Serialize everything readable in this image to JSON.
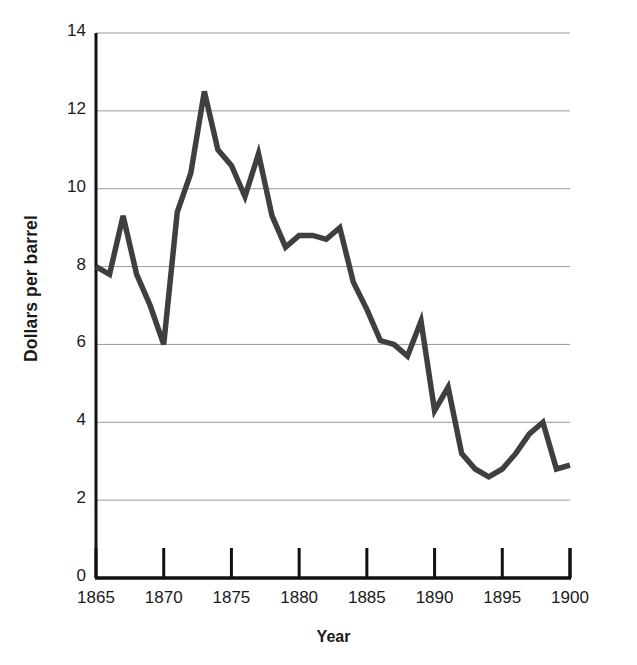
{
  "chart_data": {
    "type": "line",
    "title": "",
    "subtitle": "",
    "xlabel": "Year",
    "ylabel": "Dollars per barrel",
    "xlim": [
      1865,
      1900
    ],
    "ylim": [
      0,
      14
    ],
    "x_ticks": [
      1865,
      1870,
      1875,
      1880,
      1885,
      1890,
      1895,
      1900
    ],
    "x_tick_labels": [
      "1865",
      "1870",
      "1875",
      "1880",
      "1885",
      "1890",
      "1895",
      "1900"
    ],
    "y_ticks": [
      0,
      2,
      4,
      6,
      8,
      10,
      12,
      14
    ],
    "y_tick_labels": [
      "0",
      "2",
      "4",
      "6",
      "8",
      "10",
      "12",
      "14"
    ],
    "grid": "horizontal",
    "legend": "none",
    "series_color": "#3f3f3f",
    "axis_color": "#111111",
    "gridline_color": "#9a9a9a",
    "background": "#ffffff",
    "x": [
      1865,
      1866,
      1867,
      1868,
      1869,
      1870,
      1871,
      1872,
      1873,
      1874,
      1875,
      1876,
      1877,
      1878,
      1879,
      1880,
      1881,
      1882,
      1883,
      1884,
      1885,
      1886,
      1887,
      1888,
      1889,
      1890,
      1891,
      1892,
      1893,
      1894,
      1895,
      1896,
      1897,
      1898,
      1899,
      1900
    ],
    "values": [
      8.0,
      7.8,
      9.3,
      7.8,
      7.0,
      6.0,
      9.4,
      10.4,
      12.5,
      11.0,
      10.6,
      9.8,
      10.9,
      9.3,
      8.5,
      8.8,
      8.8,
      8.7,
      9.0,
      7.6,
      6.9,
      6.1,
      6.0,
      5.7,
      6.6,
      4.3,
      4.9,
      3.2,
      2.8,
      2.6,
      2.8,
      3.2,
      3.7,
      4.0,
      2.8,
      2.9
    ],
    "series": [
      {
        "name": "Crude oil price",
        "values": [
          8.0,
          7.8,
          9.3,
          7.8,
          7.0,
          6.0,
          9.4,
          10.4,
          12.5,
          11.0,
          10.6,
          9.8,
          10.9,
          9.3,
          8.5,
          8.8,
          8.8,
          8.7,
          9.0,
          7.6,
          6.9,
          6.1,
          6.0,
          5.7,
          6.6,
          4.3,
          4.9,
          3.2,
          2.8,
          2.6,
          2.8,
          3.2,
          3.7,
          4.0,
          2.8,
          2.9
        ]
      }
    ],
    "annotations": [
      {
        "name": "bleed-through-artifact",
        "text": ""
      }
    ]
  }
}
